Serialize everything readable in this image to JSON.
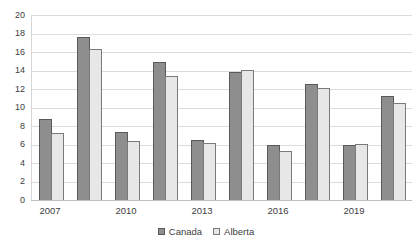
{
  "chart_data": {
    "type": "bar",
    "title": "",
    "x_labels": [
      "2007",
      "",
      "2010",
      "",
      "2013",
      "",
      "2016",
      "",
      "2019",
      ""
    ],
    "series": [
      {
        "name": "Canada",
        "fill_color": "#8e8e8e",
        "border_color": "#595959",
        "values": [
          8.8,
          17.6,
          7.3,
          14.9,
          6.5,
          13.8,
          5.9,
          12.5,
          5.9,
          11.2
        ]
      },
      {
        "name": "Alberta",
        "fill_color": "#e7e7e7",
        "border_color": "#7a7a7a",
        "values": [
          7.2,
          16.3,
          6.4,
          13.4,
          6.2,
          14.1,
          5.3,
          12.1,
          6.1,
          10.5
        ]
      }
    ],
    "y_axis": {
      "min": 0,
      "max": 20,
      "tick_step": 2,
      "ticks": [
        0,
        2,
        4,
        6,
        8,
        10,
        12,
        14,
        16,
        18,
        20
      ]
    },
    "grid": true,
    "legend_position": "bottom",
    "colors": {
      "gridline": "#dcdcdc",
      "axis_line": "#bfbfbf",
      "text": "#404040",
      "background": "#ffffff"
    }
  }
}
